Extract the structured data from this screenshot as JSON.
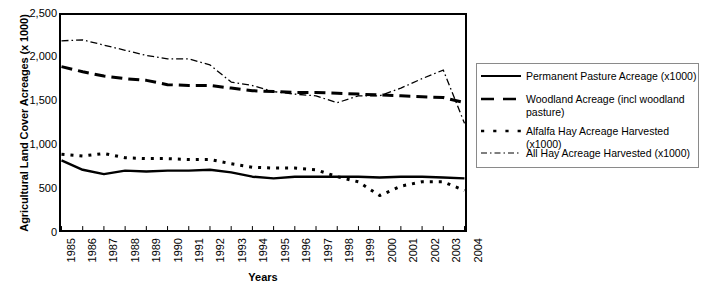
{
  "chart_data": {
    "type": "line",
    "title": "",
    "xlabel": "Years",
    "ylabel": "Agricultural Land Cover Acreages (x 1000)",
    "ylim": [
      0,
      2500
    ],
    "ytick_labels": [
      "2,500",
      "2,000",
      "1,500",
      "1,000",
      "500",
      "0"
    ],
    "ytick_values": [
      2500,
      2000,
      1500,
      1000,
      500,
      0
    ],
    "grid": false,
    "legend_position": "right",
    "categories": [
      "1985",
      "1986",
      "1987",
      "1988",
      "1989",
      "1990",
      "1991",
      "1992",
      "1993",
      "1994",
      "1995",
      "1996",
      "1997",
      "1998",
      "1999",
      "2000",
      "2001",
      "2002",
      "2003",
      "2004"
    ],
    "series": [
      {
        "name": "Permanent Pasture Acreage (x1000)",
        "style": "solid",
        "values": [
          810,
          700,
          650,
          690,
          680,
          690,
          690,
          700,
          670,
          620,
          600,
          620,
          620,
          620,
          620,
          610,
          620,
          620,
          610,
          600
        ]
      },
      {
        "name": "Woodland Acreage (incl woodland pasture)",
        "style": "dashed",
        "values": [
          1900,
          1840,
          1790,
          1760,
          1740,
          1690,
          1680,
          1680,
          1650,
          1620,
          1610,
          1600,
          1600,
          1590,
          1580,
          1570,
          1560,
          1550,
          1540,
          1480
        ]
      },
      {
        "name": "Alfalfa Hay Acreage Harvested (x1000)",
        "style": "dotted",
        "values": [
          880,
          860,
          890,
          840,
          830,
          830,
          820,
          820,
          770,
          730,
          720,
          720,
          700,
          620,
          560,
          400,
          510,
          560,
          560,
          460
        ]
      },
      {
        "name": "All Hay Acreage Harvested (x1000)",
        "style": "dashdot",
        "values": [
          2200,
          2210,
          2150,
          2090,
          2030,
          1990,
          1990,
          1920,
          1720,
          1680,
          1610,
          1580,
          1560,
          1480,
          1560,
          1560,
          1650,
          1760,
          1860,
          1240
        ]
      }
    ]
  },
  "legend": {
    "items": [
      {
        "label": "Permanent Pasture Acreage (x1000)"
      },
      {
        "label": "Woodland Acreage (incl woodland pasture)"
      },
      {
        "label": "Alfalfa Hay Acreage Harvested (x1000)"
      },
      {
        "label": "All Hay Acreage Harvested (x1000)"
      }
    ]
  },
  "axes": {
    "y_title": "Agricultural Land Cover Acreages (x 1000)",
    "x_title": "Years"
  }
}
